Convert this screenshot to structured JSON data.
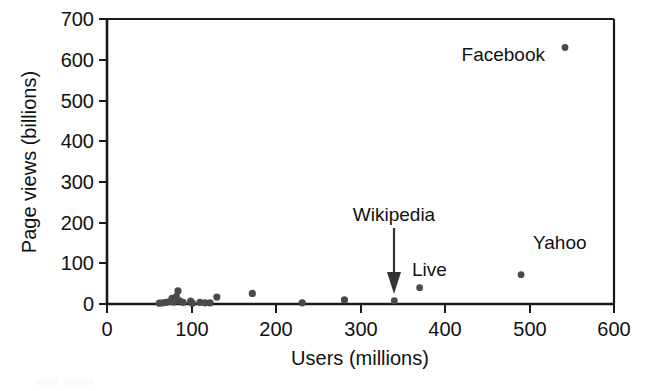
{
  "figure": {
    "name": "users-vs-pageviews-scatter",
    "background_color": "#ffffff",
    "point_color": "#4a4a4a",
    "axis_color": "#1a1a1a",
    "label_color": "#111111"
  },
  "chart_data": {
    "type": "scatter",
    "title": "",
    "xlabel": "Users (millions)",
    "ylabel": "Page views (billions)",
    "xlim": [
      0,
      600
    ],
    "ylim": [
      0,
      700
    ],
    "xticks": [
      0,
      100,
      200,
      300,
      400,
      500,
      600
    ],
    "yticks": [
      0,
      100,
      200,
      300,
      400,
      500,
      600,
      700
    ],
    "xtick_labels": [
      "0",
      "100",
      "200",
      "300",
      "400",
      "500",
      "600"
    ],
    "ytick_labels": [
      "0",
      "100",
      "200",
      "300",
      "400",
      "500",
      "600",
      "700"
    ],
    "grid": false,
    "legend": false,
    "points": [
      {
        "label": "",
        "x": 62,
        "y": 2
      },
      {
        "label": "",
        "x": 66,
        "y": 3
      },
      {
        "label": "",
        "x": 70,
        "y": 4
      },
      {
        "label": "",
        "x": 74,
        "y": 6
      },
      {
        "label": "",
        "x": 77,
        "y": 14
      },
      {
        "label": "",
        "x": 79,
        "y": 5
      },
      {
        "label": "",
        "x": 82,
        "y": 18
      },
      {
        "label": "",
        "x": 84,
        "y": 32
      },
      {
        "label": "",
        "x": 86,
        "y": 8
      },
      {
        "label": "",
        "x": 90,
        "y": 4
      },
      {
        "label": "",
        "x": 99,
        "y": 7
      },
      {
        "label": "",
        "x": 101,
        "y": 2
      },
      {
        "label": "",
        "x": 110,
        "y": 4
      },
      {
        "label": "",
        "x": 116,
        "y": 3
      },
      {
        "label": "",
        "x": 122,
        "y": 3
      },
      {
        "label": "",
        "x": 130,
        "y": 17
      },
      {
        "label": "",
        "x": 172,
        "y": 26
      },
      {
        "label": "",
        "x": 231,
        "y": 3
      },
      {
        "label": "",
        "x": 281,
        "y": 10
      },
      {
        "label": "Wikipedia",
        "x": 340,
        "y": 8
      },
      {
        "label": "Live",
        "x": 370,
        "y": 40
      },
      {
        "label": "Yahoo",
        "x": 490,
        "y": 72
      },
      {
        "label": "Facebook",
        "x": 542,
        "y": 630
      }
    ],
    "annotations": [
      {
        "text": "Facebook",
        "target_x": 542,
        "target_y": 630,
        "placement": "left-of-point",
        "has_arrow": false
      },
      {
        "text": "Wikipedia",
        "target_x": 340,
        "target_y": 8,
        "placement": "above-point",
        "has_arrow": true
      },
      {
        "text": "Live",
        "target_x": 370,
        "target_y": 40,
        "placement": "above-right-of-point",
        "has_arrow": false
      },
      {
        "text": "Yahoo",
        "target_x": 490,
        "target_y": 72,
        "placement": "above-right-of-point",
        "has_arrow": false
      }
    ]
  }
}
